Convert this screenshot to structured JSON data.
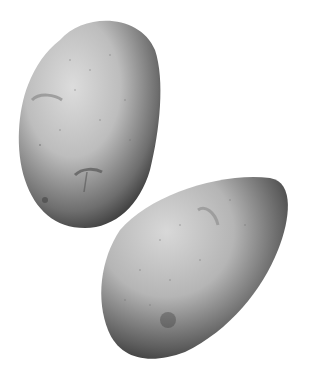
{
  "image": {
    "description": "Two grayscale potatoes on a white background",
    "background": "#ffffff",
    "subjects": [
      {
        "name": "potato-upper-left",
        "shade_light": "#d8d8d8",
        "shade_dark": "#3a3a3a"
      },
      {
        "name": "potato-lower-right",
        "shade_light": "#d4d4d4",
        "shade_dark": "#2e2e2e"
      }
    ]
  }
}
